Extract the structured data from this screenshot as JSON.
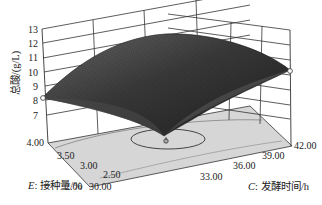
{
  "chart_data": {
    "type": "surface3d",
    "title": "",
    "zlabel": "总酸/(g/L)",
    "xlabel_var": "C:",
    "xlabel": "发酵时间/h",
    "ylabel_var": "E:",
    "ylabel": "接种量/%",
    "z_ticks": [
      "7",
      "8",
      "9",
      "10",
      "11",
      "12",
      "13"
    ],
    "zlim": [
      7,
      13
    ],
    "x_ticks": [
      "30.00",
      "33.00",
      "36.00",
      "39.00",
      "42.00"
    ],
    "xlim": [
      30,
      42
    ],
    "y_ticks": [
      "2.00",
      "2.50",
      "3.00",
      "3.50",
      "4.00"
    ],
    "ylim": [
      2,
      4
    ],
    "surface": {
      "shape": "concave-down dome (maximum near center)",
      "approx_max": 12.3,
      "corners": [
        {
          "x": 30.0,
          "y": 4.0,
          "z": 8.1
        },
        {
          "x": 42.0,
          "y": 4.0,
          "z": 11.0
        },
        {
          "x": 42.0,
          "y": 2.0,
          "z": 9.4
        },
        {
          "x": 30.0,
          "y": 2.0,
          "z": 6.9
        }
      ]
    },
    "design_points_marked": [
      {
        "x": 30.0,
        "y": 4.0,
        "z": 8.1
      },
      {
        "x": 42.0,
        "y": 2.0,
        "z": 9.4
      },
      {
        "x": 33.0,
        "y": 2.6,
        "z": 7.0
      }
    ],
    "contour_on_floor": true,
    "grid": true
  },
  "labels": {
    "z_axis_title": "总酸/(g/L)",
    "x_axis_var": "C",
    "x_axis_sep": ":",
    "x_axis_title": "发酵时间/h",
    "y_axis_var": "E",
    "y_axis_sep": ":",
    "y_axis_title": "接种量/%"
  },
  "colors": {
    "surface_dark": "#2b2b2b",
    "surface_light": "#7a7a7a",
    "floor": "#d4d4d4",
    "grid": "#333333"
  }
}
